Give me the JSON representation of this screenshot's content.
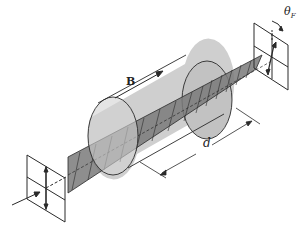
{
  "diagram": {
    "type": "faraday-rotation-illustration",
    "labels": {
      "field": "B",
      "length": "d",
      "angle_symbol": "θ",
      "angle_subscript": "F"
    },
    "colors": {
      "cylinder_fill": "#c8c8c8",
      "ribbon_fill": "#7a7a7a",
      "stroke": "#2a2a2a",
      "background": "#ffffff"
    }
  }
}
